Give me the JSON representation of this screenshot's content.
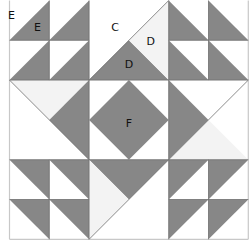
{
  "colors": {
    "dark": "#878787",
    "light": "#f3f3f3",
    "white": "#ffffff",
    "line": "#6e6e6e",
    "border": "#c8c8c8"
  },
  "grid": {
    "cols": 6,
    "rows": 6
  },
  "patches": [
    {
      "id": "tl-hst-1",
      "fill": "dark",
      "pts": [
        [
          0,
          1
        ],
        [
          1,
          0
        ],
        [
          1,
          1
        ]
      ]
    },
    {
      "id": "tl-hst-2",
      "fill": "dark",
      "pts": [
        [
          1,
          1
        ],
        [
          2,
          0
        ],
        [
          2,
          1
        ]
      ]
    },
    {
      "id": "tl-hst-3",
      "fill": "dark",
      "pts": [
        [
          0,
          2
        ],
        [
          1,
          1
        ],
        [
          1,
          2
        ]
      ]
    },
    {
      "id": "tl-hst-4",
      "fill": "dark",
      "pts": [
        [
          1,
          2
        ],
        [
          2,
          1
        ],
        [
          2,
          2
        ]
      ]
    },
    {
      "id": "top-center-d-dark",
      "fill": "dark",
      "pts": [
        [
          2,
          2
        ],
        [
          3,
          1
        ],
        [
          4,
          2
        ]
      ]
    },
    {
      "id": "top-center-d-light",
      "fill": "light",
      "pts": [
        [
          4,
          0
        ],
        [
          3,
          1
        ],
        [
          4,
          2
        ]
      ]
    },
    {
      "id": "tr-hst-1",
      "fill": "dark",
      "pts": [
        [
          4,
          0
        ],
        [
          5,
          1
        ],
        [
          4,
          1
        ]
      ]
    },
    {
      "id": "tr-hst-2",
      "fill": "dark",
      "pts": [
        [
          5,
          0
        ],
        [
          6,
          1
        ],
        [
          5,
          1
        ]
      ]
    },
    {
      "id": "tr-hst-3",
      "fill": "dark",
      "pts": [
        [
          4,
          1
        ],
        [
          5,
          2
        ],
        [
          4,
          2
        ]
      ]
    },
    {
      "id": "tr-hst-4",
      "fill": "dark",
      "pts": [
        [
          5,
          1
        ],
        [
          6,
          2
        ],
        [
          5,
          2
        ]
      ]
    },
    {
      "id": "left-light",
      "fill": "light",
      "pts": [
        [
          0,
          2
        ],
        [
          2,
          2
        ],
        [
          1,
          3
        ]
      ]
    },
    {
      "id": "left-dark",
      "fill": "dark",
      "pts": [
        [
          2,
          2
        ],
        [
          1,
          3
        ],
        [
          2,
          4
        ]
      ]
    },
    {
      "id": "center-diamond-f",
      "fill": "dark",
      "pts": [
        [
          3,
          2
        ],
        [
          4,
          3
        ],
        [
          3,
          4
        ],
        [
          2,
          3
        ]
      ]
    },
    {
      "id": "right-dark",
      "fill": "dark",
      "pts": [
        [
          4,
          2
        ],
        [
          5,
          3
        ],
        [
          4,
          4
        ]
      ]
    },
    {
      "id": "right-light",
      "fill": "light",
      "pts": [
        [
          4,
          4
        ],
        [
          5,
          3
        ],
        [
          6,
          4
        ]
      ]
    },
    {
      "id": "bl-hst-1",
      "fill": "dark",
      "pts": [
        [
          0,
          4
        ],
        [
          1,
          4
        ],
        [
          1,
          5
        ]
      ]
    },
    {
      "id": "bl-hst-2",
      "fill": "dark",
      "pts": [
        [
          1,
          4
        ],
        [
          2,
          4
        ],
        [
          2,
          5
        ]
      ]
    },
    {
      "id": "bl-hst-3",
      "fill": "dark",
      "pts": [
        [
          0,
          5
        ],
        [
          1,
          5
        ],
        [
          1,
          6
        ]
      ]
    },
    {
      "id": "bl-hst-4",
      "fill": "dark",
      "pts": [
        [
          1,
          5
        ],
        [
          2,
          5
        ],
        [
          2,
          6
        ]
      ]
    },
    {
      "id": "bottom-dark",
      "fill": "dark",
      "pts": [
        [
          2,
          4
        ],
        [
          4,
          4
        ],
        [
          3,
          5
        ]
      ]
    },
    {
      "id": "bottom-light",
      "fill": "light",
      "pts": [
        [
          2,
          4
        ],
        [
          3,
          5
        ],
        [
          2,
          6
        ]
      ]
    },
    {
      "id": "br-hst-1",
      "fill": "dark",
      "pts": [
        [
          4,
          4
        ],
        [
          5,
          4
        ],
        [
          4,
          5
        ]
      ]
    },
    {
      "id": "br-hst-2",
      "fill": "dark",
      "pts": [
        [
          5,
          4
        ],
        [
          6,
          4
        ],
        [
          5,
          5
        ]
      ]
    },
    {
      "id": "br-hst-3",
      "fill": "dark",
      "pts": [
        [
          4,
          5
        ],
        [
          5,
          5
        ],
        [
          4,
          6
        ]
      ]
    },
    {
      "id": "br-hst-4",
      "fill": "dark",
      "pts": [
        [
          5,
          5
        ],
        [
          6,
          5
        ],
        [
          5,
          6
        ]
      ]
    }
  ],
  "lines": [
    [
      [
        0,
        0
      ],
      [
        0,
        6
      ]
    ],
    [
      [
        6,
        0
      ],
      [
        6,
        6
      ]
    ],
    [
      [
        0,
        6
      ],
      [
        6,
        6
      ]
    ],
    [
      [
        0,
        1
      ],
      [
        2,
        1
      ]
    ],
    [
      [
        0,
        2
      ],
      [
        6,
        2
      ]
    ],
    [
      [
        4,
        1
      ],
      [
        6,
        1
      ]
    ],
    [
      [
        1,
        0
      ],
      [
        1,
        2
      ]
    ],
    [
      [
        2,
        0
      ],
      [
        2,
        6
      ]
    ],
    [
      [
        4,
        0
      ],
      [
        4,
        6
      ]
    ],
    [
      [
        5,
        0
      ],
      [
        5,
        2
      ]
    ],
    [
      [
        0,
        4
      ],
      [
        6,
        4
      ]
    ],
    [
      [
        0,
        5
      ],
      [
        2,
        5
      ]
    ],
    [
      [
        4,
        5
      ],
      [
        6,
        5
      ]
    ],
    [
      [
        1,
        4
      ],
      [
        1,
        6
      ]
    ],
    [
      [
        5,
        4
      ],
      [
        5,
        6
      ]
    ],
    [
      [
        0,
        2
      ],
      [
        2,
        4
      ]
    ],
    [
      [
        2,
        2
      ],
      [
        4,
        0
      ]
    ],
    [
      [
        4,
        4
      ],
      [
        6,
        2
      ]
    ],
    [
      [
        2,
        6
      ],
      [
        4,
        4
      ]
    ]
  ],
  "labels": [
    {
      "text": "E",
      "pos": [
        0.05,
        0.38
      ]
    },
    {
      "text": "E",
      "pos": [
        0.7,
        0.7
      ]
    },
    {
      "text": "C",
      "pos": [
        2.65,
        0.7
      ]
    },
    {
      "text": "D",
      "pos": [
        3.55,
        1.05
      ]
    },
    {
      "text": "D",
      "pos": [
        3.0,
        1.62
      ]
    },
    {
      "text": "F",
      "pos": [
        3.0,
        3.1
      ]
    }
  ]
}
